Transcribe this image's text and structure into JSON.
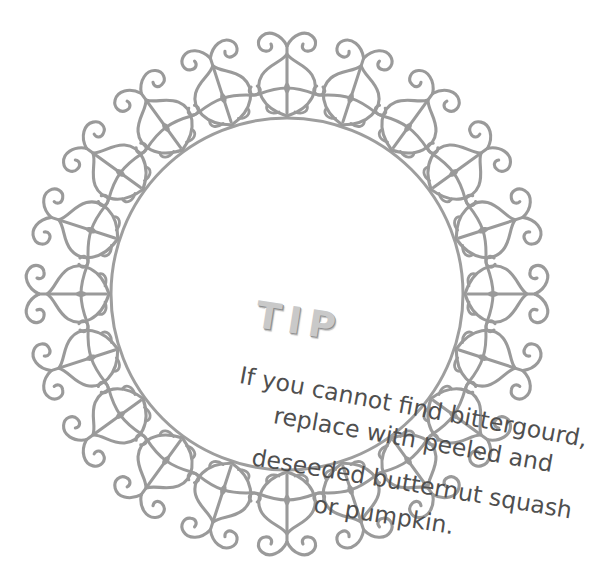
{
  "card": {
    "heading": "TIP",
    "body_lines": [
      "If you cannot find bittergourd,",
      "replace with peeled and",
      "deseeded butternut squash",
      "or pumpkin."
    ],
    "body_text": "If you cannot find bittergourd, replace with peeled and deseeded butternut squash or pumpkin."
  },
  "ornament": {
    "name": "filigree-scroll-ornament",
    "count": 20,
    "description": "wrought-iron lyre scroll with paired outward volutes"
  },
  "colors": {
    "background": "#ffffff",
    "ornament": "#9a9a9a",
    "ring": "#9e9e9e",
    "heading": "#c9c9c9",
    "heading_shadow": "#8e8e8e",
    "body_text": "#4f4f4f"
  },
  "ring": {
    "center_x": 287,
    "center_y": 294,
    "radius": 176,
    "stroke_width": 3
  }
}
